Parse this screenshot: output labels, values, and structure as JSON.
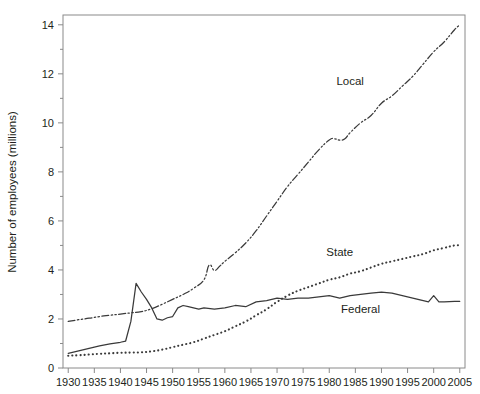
{
  "chart_data": {
    "type": "line",
    "title": "",
    "xlabel": "",
    "ylabel": "Number of employees (millions)",
    "xlim": [
      1929,
      2006
    ],
    "ylim": [
      0,
      14.4
    ],
    "yticks": [
      0,
      2,
      4,
      6,
      8,
      10,
      12,
      14
    ],
    "ytick_labels": [
      "0",
      "2",
      "4",
      "6",
      "8",
      "10",
      "12",
      "14"
    ],
    "y_minor_ticks": [
      1,
      3,
      5,
      7,
      9,
      11,
      13
    ],
    "xticks": [
      1930,
      1935,
      1940,
      1945,
      1950,
      1955,
      1960,
      1965,
      1970,
      1975,
      1980,
      1985,
      1990,
      1995,
      2000,
      2005
    ],
    "xtick_labels": [
      "1930",
      "1935",
      "1940",
      "1945",
      "1950",
      "1955",
      "1960",
      "1965",
      "1970",
      "1975",
      "1980",
      "1985",
      "1990",
      "1995",
      "2000",
      "2005"
    ],
    "grid": false,
    "legend_position": "inline-annotations",
    "series": [
      {
        "name": "Local",
        "style": "dash-dot-dot",
        "color": "#3a3a3a",
        "label_text": "Local",
        "label_x": 1984,
        "label_y": 11.55,
        "x": [
          1930,
          1932,
          1934,
          1936,
          1938,
          1940,
          1942,
          1944,
          1946,
          1948,
          1950,
          1952,
          1954,
          1956,
          1957,
          1958,
          1959,
          1960,
          1962,
          1964,
          1966,
          1968,
          1970,
          1972,
          1974,
          1976,
          1978,
          1980,
          1981,
          1982,
          1983,
          1984,
          1986,
          1988,
          1990,
          1992,
          1994,
          1996,
          1998,
          2000,
          2002,
          2004,
          2005
        ],
        "y": [
          1.9,
          1.97,
          2.03,
          2.1,
          2.15,
          2.2,
          2.25,
          2.3,
          2.42,
          2.6,
          2.8,
          3.0,
          3.25,
          3.6,
          4.2,
          3.98,
          4.15,
          4.35,
          4.7,
          5.1,
          5.6,
          6.2,
          6.8,
          7.4,
          7.9,
          8.4,
          8.9,
          9.3,
          9.35,
          9.3,
          9.35,
          9.6,
          10.0,
          10.3,
          10.8,
          11.1,
          11.5,
          11.9,
          12.4,
          12.9,
          13.3,
          13.8,
          14.0
        ]
      },
      {
        "name": "State",
        "style": "dotted",
        "color": "#3a3a3a",
        "label_text": "State",
        "label_x": 1982,
        "label_y": 4.55,
        "x": [
          1930,
          1932,
          1934,
          1936,
          1938,
          1940,
          1942,
          1944,
          1946,
          1948,
          1950,
          1952,
          1954,
          1956,
          1958,
          1960,
          1962,
          1964,
          1966,
          1968,
          1970,
          1972,
          1974,
          1976,
          1978,
          1980,
          1982,
          1984,
          1986,
          1988,
          1990,
          1992,
          1994,
          1996,
          1998,
          2000,
          2002,
          2004,
          2005
        ],
        "y": [
          0.5,
          0.52,
          0.55,
          0.58,
          0.6,
          0.62,
          0.63,
          0.64,
          0.68,
          0.75,
          0.85,
          0.95,
          1.05,
          1.2,
          1.35,
          1.5,
          1.7,
          1.9,
          2.15,
          2.4,
          2.7,
          2.95,
          3.15,
          3.3,
          3.45,
          3.6,
          3.7,
          3.85,
          3.95,
          4.1,
          4.25,
          4.35,
          4.45,
          4.55,
          4.65,
          4.8,
          4.9,
          5.0,
          5.0
        ]
      },
      {
        "name": "Federal",
        "style": "solid",
        "color": "#3a3a3a",
        "label_text": "Federal",
        "label_x": 1986,
        "label_y": 2.25,
        "x": [
          1930,
          1932,
          1934,
          1936,
          1938,
          1940,
          1941,
          1942,
          1943,
          1944,
          1945,
          1946,
          1947,
          1948,
          1949,
          1950,
          1951,
          1952,
          1953,
          1954,
          1955,
          1956,
          1958,
          1960,
          1962,
          1964,
          1966,
          1968,
          1970,
          1972,
          1974,
          1976,
          1978,
          1980,
          1982,
          1984,
          1986,
          1988,
          1990,
          1992,
          1994,
          1996,
          1998,
          1999,
          2000,
          2001,
          2002,
          2004,
          2005
        ],
        "y": [
          0.6,
          0.7,
          0.8,
          0.9,
          0.98,
          1.05,
          1.1,
          1.9,
          3.45,
          3.1,
          2.8,
          2.45,
          2.0,
          1.95,
          2.05,
          2.1,
          2.45,
          2.55,
          2.5,
          2.45,
          2.4,
          2.45,
          2.4,
          2.45,
          2.55,
          2.5,
          2.7,
          2.75,
          2.85,
          2.8,
          2.85,
          2.85,
          2.9,
          2.95,
          2.85,
          2.95,
          3.0,
          3.05,
          3.1,
          3.05,
          2.95,
          2.85,
          2.75,
          2.7,
          2.95,
          2.7,
          2.7,
          2.72,
          2.72
        ]
      }
    ]
  }
}
